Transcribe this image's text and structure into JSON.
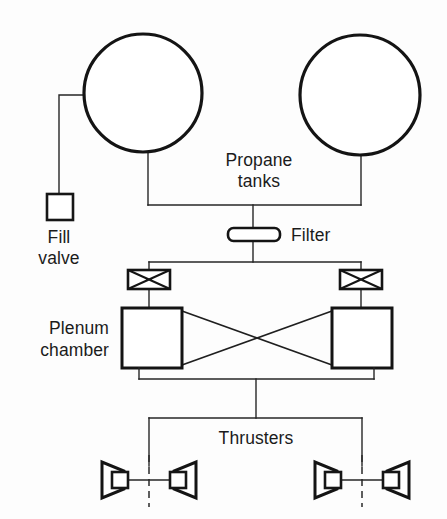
{
  "diagram": {
    "background_color": "#fdfdfd",
    "line_color": "#141414",
    "labels": {
      "propane_tanks_line1": "Propane",
      "propane_tanks_line2": "tanks",
      "fill_valve_line1": "Fill",
      "fill_valve_line2": "valve",
      "filter": "Filter",
      "plenum_chamber_line1": "Plenum",
      "plenum_chamber_line2": "chamber",
      "thrusters": "Thrusters"
    },
    "components": [
      {
        "name": "propane-tank-left",
        "type": "circle",
        "cx": 143,
        "cy": 93,
        "r": 59
      },
      {
        "name": "propane-tank-right",
        "type": "circle",
        "cx": 360,
        "cy": 95,
        "r": 60
      },
      {
        "name": "fill-valve",
        "type": "square",
        "x": 47,
        "y": 194,
        "w": 26,
        "h": 26
      },
      {
        "name": "filter",
        "type": "rounded-bar",
        "x": 228,
        "y": 228,
        "w": 52,
        "h": 13
      },
      {
        "name": "isolation-valve-left",
        "type": "x-valve",
        "x": 128,
        "y": 270,
        "w": 42,
        "h": 19
      },
      {
        "name": "isolation-valve-right",
        "type": "x-valve",
        "x": 340,
        "y": 270,
        "w": 42,
        "h": 19
      },
      {
        "name": "plenum-box-left",
        "type": "rect",
        "x": 122,
        "y": 308,
        "w": 60,
        "h": 60
      },
      {
        "name": "plenum-box-right",
        "type": "rect",
        "x": 332,
        "y": 308,
        "w": 60,
        "h": 60
      },
      {
        "name": "thruster-nozzle-1",
        "type": "nozzle",
        "direction": "left",
        "cx": 113,
        "cy": 480
      },
      {
        "name": "thruster-nozzle-2",
        "type": "nozzle",
        "direction": "right",
        "cx": 181,
        "cy": 480
      },
      {
        "name": "thruster-nozzle-3",
        "type": "nozzle",
        "direction": "left",
        "cx": 324,
        "cy": 480
      },
      {
        "name": "thruster-nozzle-4",
        "type": "nozzle",
        "direction": "right",
        "cx": 392,
        "cy": 480
      }
    ],
    "counts": {
      "tanks": 2,
      "valves": 2,
      "plenum_chambers": 2,
      "thrusters": 4,
      "filters": 1,
      "fill_valves": 1
    }
  }
}
